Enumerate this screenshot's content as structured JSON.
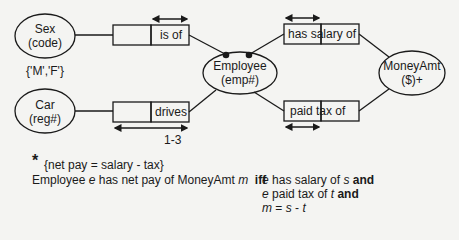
{
  "entities": {
    "sex": {
      "name": "Sex",
      "ref": "(code)",
      "values": "{'M','F'}"
    },
    "car": {
      "name": "Car",
      "ref": "(reg#)"
    },
    "employee": {
      "name": "Employee",
      "ref": "(emp#)"
    },
    "moneyamt": {
      "name": "MoneyAmt",
      "ref": "($)+"
    }
  },
  "facts": {
    "is_of": {
      "role_label": "is of"
    },
    "drives": {
      "role_label": "drives",
      "frequency": "1-3"
    },
    "has_salary_of": {
      "role_label": "has salary of"
    },
    "paid_tax_of": {
      "role_label": "paid tax of"
    }
  },
  "derivation": {
    "asterisk": "*",
    "rule": "{net pay = salary - tax}",
    "line_prefix": "Employee",
    "var_e": "e",
    "line_mid": "has net pay of MoneyAmt",
    "var_m": "m",
    "iff": "iff",
    "cond1": {
      "var": "e",
      "text": "has salary of",
      "var2": "s",
      "conj": "and"
    },
    "cond2": {
      "var": "e",
      "text": "paid tax of",
      "var2": "t",
      "conj": "and"
    },
    "cond3": {
      "var": "m",
      "op1": "=",
      "var2": "s",
      "op2": "-",
      "var3": "t"
    }
  }
}
